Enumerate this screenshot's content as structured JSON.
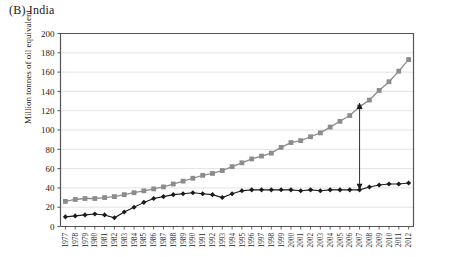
{
  "panel": {
    "title": "(B) India"
  },
  "chart_data": {
    "type": "line",
    "title": "(B) India",
    "xlabel": "",
    "ylabel": "Million tonnes of oil equivalent",
    "ylim": [
      0,
      200
    ],
    "ytick_step": 20,
    "yticks": [
      0,
      20,
      40,
      60,
      80,
      100,
      120,
      140,
      160,
      180,
      200
    ],
    "grid": true,
    "legend": "none",
    "categories": [
      "1977",
      "1978",
      "1979",
      "1980",
      "1981",
      "1982",
      "1983",
      "1984",
      "1985",
      "1986",
      "1987",
      "1988",
      "1989",
      "1990",
      "1991",
      "1992",
      "1993",
      "1994",
      "1995",
      "1996",
      "1997",
      "1998",
      "1999",
      "2000",
      "2001",
      "2002",
      "2003",
      "2004",
      "2005",
      "2006",
      "2007",
      "2008",
      "2009",
      "2010",
      "2011",
      "2012"
    ],
    "series": [
      {
        "name": "total-primary-energy",
        "marker": "square",
        "color": "#8c8c8c",
        "values": [
          26,
          28,
          29,
          29,
          30,
          31,
          33,
          35,
          37,
          39,
          41,
          44,
          47,
          50,
          53,
          55,
          58,
          62,
          66,
          70,
          73,
          76,
          82,
          87,
          89,
          93,
          97,
          103,
          109,
          115,
          124,
          131,
          141,
          150,
          161,
          173
        ]
      },
      {
        "name": "lower-series",
        "marker": "diamond",
        "color": "#1a1a1a",
        "values": [
          10,
          11,
          12,
          13,
          12,
          9,
          15,
          20,
          25,
          29,
          31,
          33,
          34,
          35,
          34,
          33,
          30,
          34,
          37,
          38,
          38,
          38,
          38,
          38,
          37,
          38,
          37,
          38,
          38,
          38,
          38,
          41,
          43,
          44,
          44,
          45
        ]
      }
    ],
    "annotations": [
      {
        "type": "double-headed-arrow",
        "at_category": "2007",
        "from_value": 38,
        "to_value": 128,
        "color": "#1a1a1a"
      }
    ]
  }
}
